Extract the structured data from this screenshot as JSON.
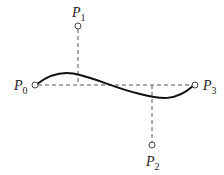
{
  "diagram": {
    "title": "",
    "type": "cubic-bezier-control-points",
    "points": [
      {
        "name": "P0",
        "label": "P",
        "sub": "0",
        "x": 35,
        "y": 85
      },
      {
        "name": "P1",
        "label": "P",
        "sub": "1",
        "x": 78,
        "y": 26
      },
      {
        "name": "P2",
        "label": "P",
        "sub": "2",
        "x": 152,
        "y": 145
      },
      {
        "name": "P3",
        "label": "P",
        "sub": "3",
        "x": 195,
        "y": 85
      }
    ],
    "colors": {
      "curve": "#111111",
      "dashed": "#555555",
      "point": "#444444"
    }
  }
}
